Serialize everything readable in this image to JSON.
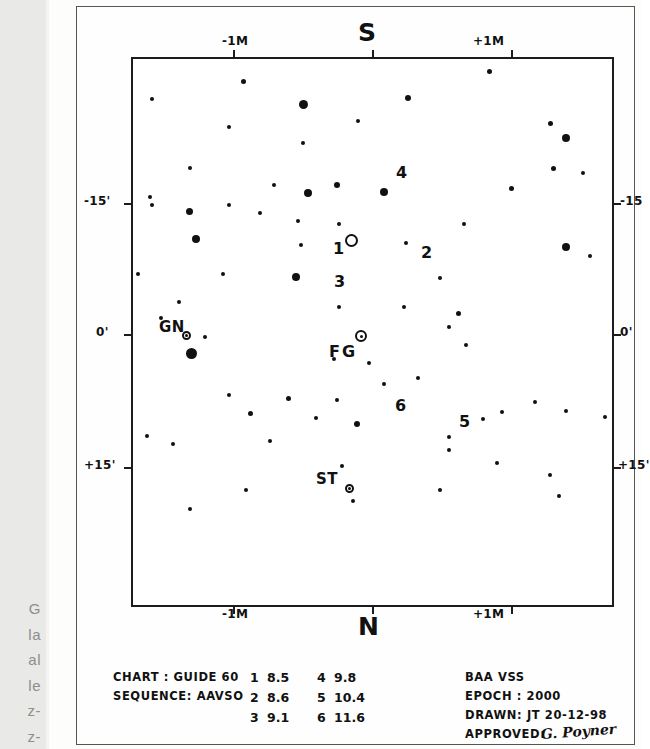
{
  "chart_data": {
    "type": "scatter",
    "title": "S",
    "subtitle": "N",
    "xlabel": "",
    "ylabel": "",
    "grid": false,
    "legend_position": "none",
    "axes": {
      "top_label": "S",
      "bottom_label": "N",
      "x_ticks": [
        "-1M",
        "+1M"
      ],
      "y_ticks_left": [
        "-15'",
        "0'",
        "+15'"
      ],
      "y_ticks_right": [
        "-15",
        "0'",
        "+15'"
      ]
    },
    "markers": [
      {
        "label": "1",
        "mag": 8.5
      },
      {
        "label": "2",
        "mag": 8.6
      },
      {
        "label": "3",
        "mag": 9.1
      },
      {
        "label": "4",
        "mag": 9.8
      },
      {
        "label": "5",
        "mag": 10.4
      },
      {
        "label": "6",
        "mag": 11.6
      },
      {
        "label": "FG",
        "mag": null
      },
      {
        "label": "GN",
        "mag": null
      },
      {
        "label": "ST",
        "mag": null
      }
    ],
    "stars": [
      [
        0.355,
        0.083,
        9
      ],
      [
        0.23,
        0.041,
        5
      ],
      [
        0.575,
        0.071,
        6
      ],
      [
        0.745,
        0.022,
        5
      ],
      [
        0.47,
        0.114,
        4
      ],
      [
        0.872,
        0.118,
        5
      ],
      [
        0.905,
        0.145,
        8
      ],
      [
        0.355,
        0.153,
        4
      ],
      [
        0.2,
        0.125,
        4
      ],
      [
        0.04,
        0.074,
        4
      ],
      [
        0.877,
        0.2,
        5
      ],
      [
        0.295,
        0.23,
        4
      ],
      [
        0.12,
        0.2,
        4
      ],
      [
        0.365,
        0.245,
        8
      ],
      [
        0.425,
        0.23,
        6
      ],
      [
        0.525,
        0.244,
        8
      ],
      [
        0.94,
        0.208,
        4
      ],
      [
        0.79,
        0.237,
        5
      ],
      [
        0.035,
        0.253,
        4
      ],
      [
        0.04,
        0.268,
        4
      ],
      [
        0.2,
        0.268,
        4
      ],
      [
        0.265,
        0.282,
        4
      ],
      [
        0.118,
        0.279,
        7
      ],
      [
        0.43,
        0.302,
        4
      ],
      [
        0.345,
        0.296,
        4
      ],
      [
        0.69,
        0.303,
        4
      ],
      [
        0.132,
        0.33,
        8
      ],
      [
        0.35,
        0.34,
        4
      ],
      [
        0.57,
        0.337,
        4
      ],
      [
        0.34,
        0.4,
        8
      ],
      [
        0.01,
        0.393,
        4
      ],
      [
        0.188,
        0.394,
        4
      ],
      [
        0.64,
        0.402,
        4
      ],
      [
        0.565,
        0.454,
        4
      ],
      [
        0.68,
        0.466,
        5
      ],
      [
        0.095,
        0.445,
        4
      ],
      [
        0.43,
        0.455,
        4
      ],
      [
        0.905,
        0.345,
        8
      ],
      [
        0.955,
        0.36,
        4
      ],
      [
        0.66,
        0.49,
        4
      ],
      [
        0.058,
        0.475,
        4
      ],
      [
        0.15,
        0.51,
        4
      ],
      [
        0.123,
        0.54,
        11
      ],
      [
        0.695,
        0.523,
        4
      ],
      [
        0.42,
        0.549,
        4
      ],
      [
        0.493,
        0.556,
        4
      ],
      [
        0.595,
        0.585,
        4
      ],
      [
        0.425,
        0.625,
        4
      ],
      [
        0.525,
        0.596,
        4
      ],
      [
        0.84,
        0.628,
        4
      ],
      [
        0.2,
        0.615,
        4
      ],
      [
        0.325,
        0.622,
        5
      ],
      [
        0.77,
        0.646,
        4
      ],
      [
        0.245,
        0.65,
        5
      ],
      [
        0.73,
        0.66,
        4
      ],
      [
        0.383,
        0.658,
        4
      ],
      [
        0.467,
        0.668,
        6
      ],
      [
        0.03,
        0.69,
        4
      ],
      [
        0.083,
        0.705,
        4
      ],
      [
        0.285,
        0.7,
        4
      ],
      [
        0.66,
        0.692,
        4
      ],
      [
        0.66,
        0.717,
        4
      ],
      [
        0.437,
        0.745,
        4
      ],
      [
        0.76,
        0.74,
        4
      ],
      [
        0.905,
        0.645,
        4
      ],
      [
        0.985,
        0.655,
        4
      ],
      [
        0.87,
        0.762,
        4
      ],
      [
        0.64,
        0.79,
        4
      ],
      [
        0.89,
        0.8,
        4
      ],
      [
        0.46,
        0.81,
        4
      ],
      [
        0.235,
        0.79,
        4
      ],
      [
        0.12,
        0.825,
        4
      ]
    ]
  },
  "marginalia": {
    "bleed_lines": [
      "G",
      "la",
      "al",
      "le",
      "z-",
      "z-"
    ]
  },
  "footer": {
    "left_block": [
      {
        "key": "CHART :",
        "value": "GUIDE 60"
      },
      {
        "key": "SEQUENCE:",
        "value": "AAVSO"
      }
    ],
    "magnitudes": [
      {
        "id": "1",
        "mag": "8.5",
        "id2": "4",
        "mag2": "9.8"
      },
      {
        "id": "2",
        "mag": "8.6",
        "id2": "5",
        "mag2": "10.4"
      },
      {
        "id": "3",
        "mag": "9.1",
        "id2": "6",
        "mag2": "11.6"
      }
    ],
    "right_block": [
      {
        "key": "BAA",
        "value": "VSS"
      },
      {
        "key": "EPOCH :",
        "value": "2000"
      },
      {
        "key": "DRAWN:",
        "value": "JT 20-12-98"
      },
      {
        "key": "APPROVED:",
        "value": ""
      }
    ],
    "signature": "G. Poyner"
  },
  "labels": {
    "north": "N",
    "south": "S",
    "x_left": "-1M",
    "x_right": "+1M",
    "y_top": "-15'",
    "y_mid": "0'",
    "y_bot": "+15'",
    "y_top_right": "-15",
    "y_mid_right": "0'",
    "y_bot_right": "+15'",
    "star1": "1",
    "star2": "2",
    "star3": "3",
    "star4": "4",
    "star5": "5",
    "star6": "6",
    "variable": "FG",
    "field_gn": "GN",
    "field_st": "ST"
  },
  "colors": {
    "ink": "#111111",
    "paper": "#fefefe",
    "bleed": "#e9e9e7"
  }
}
